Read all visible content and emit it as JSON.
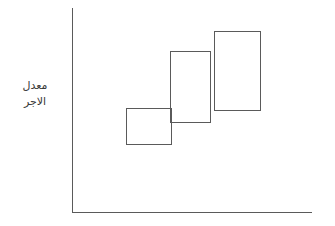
{
  "figure": {
    "title": "",
    "background_color": "#ffffff",
    "line_color": "#5a5a5a",
    "width": 335,
    "height": 226
  },
  "axes": {
    "y_axis_label_line1": "معدل",
    "y_axis_label_line2": "الاجر",
    "y_axis_label_full": "معدل الاجر",
    "x_axis_label": "",
    "y_axis": {
      "x": 72,
      "top": 8,
      "bottom": 213
    },
    "x_axis": {
      "y": 212,
      "left": 72,
      "right": 312
    }
  },
  "chart_data": {
    "type": "bar",
    "title": "",
    "xlabel": "",
    "ylabel": "معدل الاجر",
    "grid": false,
    "legend": "none",
    "note": "Three overlapping open rectangles forming an ascending staircase pattern (step function of wage rate). Values are read as pixel extents relative to the axes; no numeric tick labels are printed on the figure.",
    "categories": [
      "1",
      "2",
      "3"
    ],
    "values": [
      37,
      72,
      80
    ],
    "xlim": [
      72,
      312
    ],
    "ylim": [
      8,
      212
    ],
    "rectangles": [
      {
        "name": "step-1",
        "x": 126,
        "y": 108,
        "width": 46,
        "height": 37
      },
      {
        "name": "step-2",
        "x": 170,
        "y": 51,
        "width": 41,
        "height": 72
      },
      {
        "name": "step-3",
        "x": 214,
        "y": 31,
        "width": 47,
        "height": 80
      }
    ]
  }
}
